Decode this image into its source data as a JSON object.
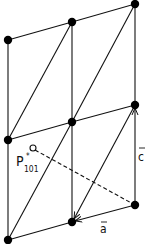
{
  "diagram": {
    "type": "crystal-lattice",
    "labels": {
      "vector_c": "c",
      "vector_a": "a",
      "point_p": "P",
      "point_p_superscript": "*",
      "point_p_subscript": "101"
    },
    "colors": {
      "line": "#111111",
      "point": "#000000",
      "background": "#ffffff"
    },
    "lattice_points": [
      {
        "id": "top-left",
        "x": 8,
        "y": 40
      },
      {
        "id": "top-mid",
        "x": 72,
        "y": 22
      },
      {
        "id": "top-right",
        "x": 135,
        "y": 4
      },
      {
        "id": "mid-left",
        "x": 8,
        "y": 140
      },
      {
        "id": "mid-mid",
        "x": 72,
        "y": 122
      },
      {
        "id": "mid-right",
        "x": 135,
        "y": 105
      },
      {
        "id": "bot-left",
        "x": 8,
        "y": 240
      },
      {
        "id": "bot-mid",
        "x": 72,
        "y": 222
      },
      {
        "id": "bot-right",
        "x": 135,
        "y": 205
      }
    ],
    "reciprocal_point": {
      "x": 32,
      "y": 148
    }
  }
}
